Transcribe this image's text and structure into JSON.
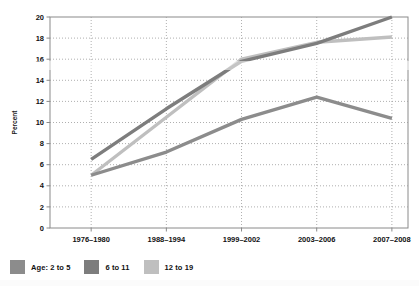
{
  "chart_data": {
    "type": "line",
    "title": "",
    "subtitle": "",
    "xlabel": "",
    "ylabel": "Percent",
    "categories": [
      "1976–1980",
      "1988–1994",
      "1999–2002",
      "2003–2006",
      "2007–2008"
    ],
    "ylim": [
      0,
      20
    ],
    "ytick_values": [
      0,
      2,
      4,
      6,
      8,
      10,
      12,
      14,
      16,
      18,
      20
    ],
    "ytick_labels": [
      "0",
      "2",
      "4",
      "6",
      "8",
      "10",
      "12",
      "14",
      "16",
      "18",
      "20"
    ],
    "grid": true,
    "grid_style": "dotted",
    "legend_position": "below",
    "series": [
      {
        "name": "Age: 2 to 5",
        "legend_label": "Age: 2 to 5",
        "color": "#8c8c8c",
        "values": [
          5.0,
          7.2,
          10.3,
          12.4,
          10.4
        ]
      },
      {
        "name": "6 to 11",
        "legend_label": "6 to 11",
        "color": "#7d7d7d",
        "values": [
          6.5,
          11.3,
          15.8,
          17.5,
          20.0
        ]
      },
      {
        "name": "12 to 19",
        "legend_label": "12 to 19",
        "color": "#bfbfbf",
        "values": [
          5.0,
          10.5,
          16.0,
          17.6,
          18.1
        ]
      }
    ]
  },
  "axis": {
    "y_title": "Percent"
  },
  "legend": {
    "items": [
      {
        "label": "Age: 2 to 5",
        "color": "#8c8c8c"
      },
      {
        "label": "6 to 11",
        "color": "#7d7d7d"
      },
      {
        "label": "12 to 19",
        "color": "#bfbfbf"
      }
    ]
  },
  "colors": {
    "axis": "#8a8a8a",
    "grid": "#9a9a9a",
    "text": "#111111",
    "background": "#ffffff"
  }
}
